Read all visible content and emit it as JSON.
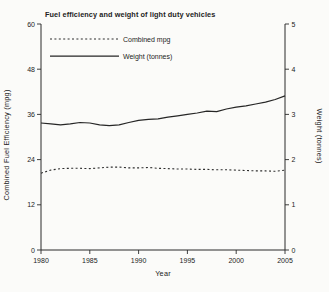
{
  "figure": {
    "background": "#fbfbf9",
    "ink_color": "#262626"
  },
  "chart_data": {
    "type": "line",
    "title": "Fuel efficiency and weight of light duty vehicles",
    "xlabel": "Year",
    "ylabel_left": "Combined Fuel Efficiency (mpg)",
    "ylabel_right": "Weight (tonnes)",
    "grid": false,
    "legend_position": "top-left",
    "x_range": [
      1980,
      2005
    ],
    "x_ticks": [
      1980,
      1985,
      1990,
      1995,
      2000,
      2005
    ],
    "left_axis": {
      "min": 0,
      "max": 60,
      "ticks": [
        0,
        12,
        24,
        36,
        48,
        60
      ]
    },
    "right_axis": {
      "min": 0,
      "max": 5,
      "ticks": [
        0,
        1,
        2,
        3,
        4,
        5
      ]
    },
    "x": [
      1980,
      1981,
      1982,
      1983,
      1984,
      1985,
      1986,
      1987,
      1988,
      1989,
      1990,
      1991,
      1992,
      1993,
      1994,
      1995,
      1996,
      1997,
      1998,
      1999,
      2000,
      2001,
      2002,
      2003,
      2004,
      2005
    ],
    "series": [
      {
        "name": "Combined mpg",
        "axis": "left",
        "style": "dashed",
        "values": [
          20.4,
          21.2,
          21.6,
          21.7,
          21.7,
          21.6,
          21.8,
          22.0,
          22.0,
          21.8,
          21.8,
          21.9,
          21.7,
          21.6,
          21.5,
          21.5,
          21.4,
          21.4,
          21.3,
          21.3,
          21.2,
          21.1,
          21.0,
          21.0,
          20.9,
          21.2
        ]
      },
      {
        "name": "Weight (tonnes)",
        "axis": "right",
        "style": "solid",
        "values": [
          2.81,
          2.79,
          2.77,
          2.79,
          2.82,
          2.81,
          2.77,
          2.75,
          2.77,
          2.82,
          2.87,
          2.89,
          2.9,
          2.94,
          2.97,
          3.0,
          3.03,
          3.07,
          3.06,
          3.12,
          3.16,
          3.19,
          3.23,
          3.27,
          3.33,
          3.41
        ]
      }
    ]
  }
}
